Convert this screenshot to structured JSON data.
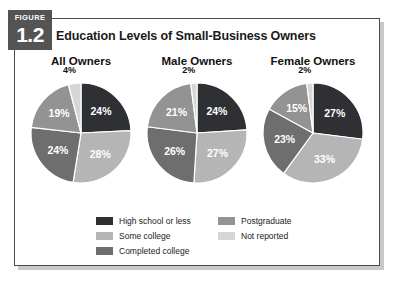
{
  "figure": {
    "tab_word": "FIGURE",
    "tab_number": "1.2",
    "title": "Education Levels of Small-Business Owners"
  },
  "colors": {
    "high_school_or_less": "#2f3033",
    "some_college": "#b5b5b5",
    "completed_college": "#6e6e6e",
    "postgraduate": "#939393",
    "not_reported": "#d6d6d6",
    "tab_background": "#545454",
    "frame_border": "#4a4a4a",
    "slice_outline": "#ffffff",
    "text": "#1a1a1a"
  },
  "legend": {
    "left_column": [
      {
        "label": "High school or less",
        "color_key": "high_school_or_less"
      },
      {
        "label": "Some college",
        "color_key": "some_college"
      },
      {
        "label": "Completed college",
        "color_key": "completed_college"
      }
    ],
    "right_column": [
      {
        "label": "Postgraduate",
        "color_key": "postgraduate"
      },
      {
        "label": "Not reported",
        "color_key": "not_reported"
      }
    ]
  },
  "chart_data": {
    "type": "pie",
    "title": "Education Levels of Small-Business Owners",
    "xlabel": "",
    "ylabel": "",
    "legend_position": "bottom",
    "value_unit": "%",
    "categories": [
      "High school or less",
      "Some college",
      "Completed college",
      "Postgraduate",
      "Not reported"
    ],
    "category_colors": [
      "#2f3033",
      "#b5b5b5",
      "#6e6e6e",
      "#939393",
      "#d6d6d6"
    ],
    "charts": [
      {
        "title": "All Owners",
        "labels": [
          "24%",
          "28%",
          "24%",
          "19%",
          "4%"
        ],
        "values": [
          24,
          28,
          24,
          19,
          4
        ],
        "label_placement": [
          "inside",
          "inside",
          "inside",
          "inside",
          "outside"
        ]
      },
      {
        "title": "Male Owners",
        "labels": [
          "24%",
          "27%",
          "26%",
          "21%",
          "2%"
        ],
        "values": [
          24,
          27,
          26,
          21,
          2
        ],
        "label_placement": [
          "inside",
          "inside",
          "inside",
          "inside",
          "outside"
        ]
      },
      {
        "title": "Female Owners",
        "labels": [
          "27%",
          "33%",
          "23%",
          "15%",
          "2%"
        ],
        "values": [
          27,
          33,
          23,
          15,
          2
        ],
        "label_placement": [
          "inside",
          "inside",
          "inside",
          "inside",
          "outside"
        ]
      }
    ]
  }
}
